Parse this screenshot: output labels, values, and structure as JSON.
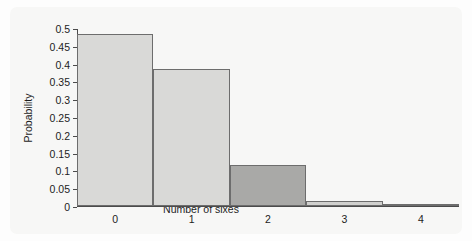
{
  "chart_data": {
    "type": "bar",
    "title": "",
    "subtitle": "",
    "xlabel": "Number of sixes",
    "ylabel": "Probability",
    "categories": [
      "0",
      "1",
      "2",
      "3",
      "4"
    ],
    "values": [
      0.482,
      0.386,
      0.116,
      0.015,
      0.001
    ],
    "series": [
      {
        "name": "Probability",
        "values": [
          0.482,
          0.386,
          0.116,
          0.015,
          0.001
        ]
      }
    ],
    "xlim": [
      -0.5,
      4.5
    ],
    "ylim": [
      0,
      0.5
    ],
    "yticks": [
      "0",
      "0.05",
      "0.1",
      "0.15",
      "0.2",
      "0.25",
      "0.3",
      "0.35",
      "0.4",
      "0.45",
      "0.5"
    ],
    "ytick_values": [
      0,
      0.05,
      0.1,
      0.15,
      0.2,
      0.25,
      0.3,
      0.35,
      0.4,
      0.45,
      0.5
    ],
    "xticks": [
      "0",
      "1",
      "2",
      "3",
      "4"
    ],
    "grid": false,
    "legend": "none",
    "bar_colors": [
      "#d9d9d7",
      "#d9d9d7",
      "#a9a9a7",
      "#d0d0ce",
      "#d9d9d7"
    ],
    "bar_edge_color": "#6d6d6d",
    "axis_color": "#4b4b4b",
    "background_color": "#f7f7f6"
  },
  "bleed_text": {
    "line1": "",
    "line2": "",
    "line3": "",
    "line4": ""
  }
}
